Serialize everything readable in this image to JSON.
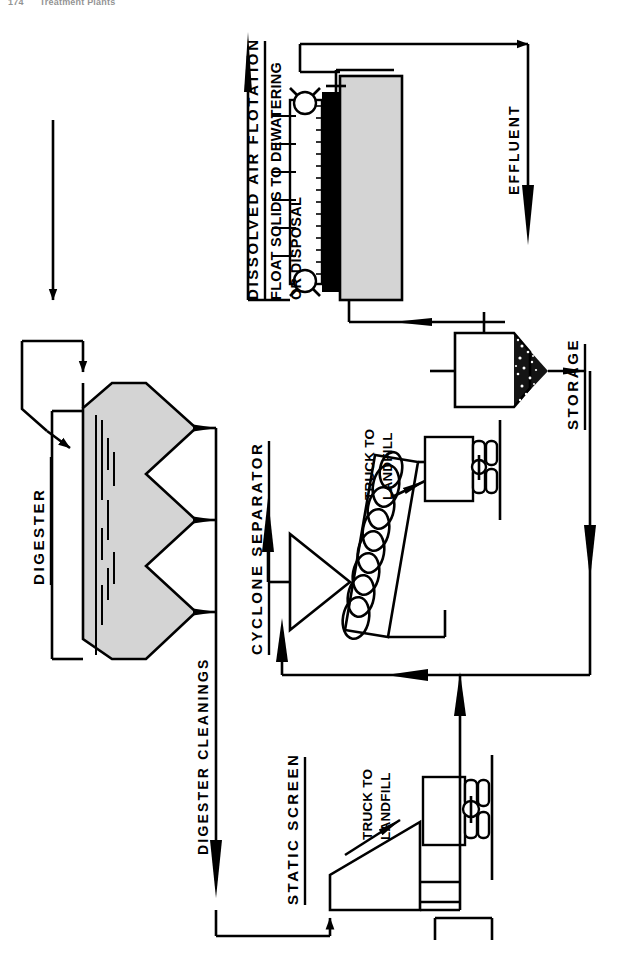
{
  "page": {
    "folio": "174",
    "running_head": "Treatment Plants",
    "width": 624,
    "height": 961
  },
  "diagram": {
    "kind": "process-flow-diagram",
    "orientation": "rotated-90-ccw",
    "title_labels": {
      "digester": "DIGESTER",
      "dissolved_air_flotation": "DISSOLVED AIR FLOTATION",
      "cyclone_separator": "CYCLONE SEPARATOR",
      "static_screen": "STATIC SCREEN",
      "storage": "STORAGE"
    },
    "flow_labels": {
      "effluent": "EFFLUENT",
      "digester_cleanings": "DIGESTER CLEANINGS",
      "float_solids": "FLOAT SOLIDS TO DEWATERING OR DISPOSAL",
      "float_solids_line1": "FLOAT SOLIDS TO DEWATERING",
      "float_solids_line2": "OR DISPOSAL",
      "truck_to_landfill_upper_line1": "TRUCK TO",
      "truck_to_landfill_upper_line2": "LANDFILL",
      "truck_to_landfill_lower_line1": "TRUCK TO",
      "truck_to_landfill_lower_line2": "LANDFILL"
    },
    "colors": {
      "ink": "#000000",
      "tank_fill": "#d4d4d4",
      "sludge_band": "#000000",
      "paper": "#ffffff"
    },
    "units": [
      {
        "id": "digester",
        "label": "DIGESTER",
        "shape": "hopper-bottom-tank",
        "fill": "#d4d4d4",
        "hopper_count": 3
      },
      {
        "id": "daf",
        "label": "DISSOLVED AIR FLOTATION",
        "shape": "rectangular-basin-with-skimmer",
        "fill": "#d4d4d4"
      },
      {
        "id": "cyclone",
        "label": "CYCLONE SEPARATOR",
        "shape": "cone-plus-screw-conveyor"
      },
      {
        "id": "static-screen",
        "label": "STATIC SCREEN",
        "shape": "inclined-wedge-screen"
      },
      {
        "id": "storage",
        "label": "STORAGE",
        "shape": "hopper-tank"
      },
      {
        "id": "truck-upper",
        "label": "TRUCK TO LANDFILL",
        "shape": "truck-trailer"
      },
      {
        "id": "truck-lower",
        "label": "TRUCK TO LANDFILL",
        "shape": "truck-trailer"
      }
    ],
    "streams": [
      {
        "from": "influent",
        "to": "digester",
        "label": ""
      },
      {
        "from": "digester",
        "to": "daf",
        "label": ""
      },
      {
        "from": "daf",
        "to": "effluent",
        "label": "EFFLUENT"
      },
      {
        "from": "daf",
        "to": "float-solids",
        "label": "FLOAT SOLIDS TO DEWATERING OR DISPOSAL"
      },
      {
        "from": "digester",
        "to": "static-screen",
        "label": "DIGESTER CLEANINGS"
      },
      {
        "from": "static-screen",
        "to": "cyclone",
        "label": ""
      },
      {
        "from": "cyclone",
        "to": "truck-upper",
        "label": "TRUCK TO LANDFILL"
      },
      {
        "from": "static-screen",
        "to": "truck-lower",
        "label": "TRUCK TO LANDFILL"
      },
      {
        "from": "cyclone",
        "to": "storage",
        "label": ""
      },
      {
        "from": "storage",
        "to": "daf",
        "label": ""
      }
    ]
  }
}
